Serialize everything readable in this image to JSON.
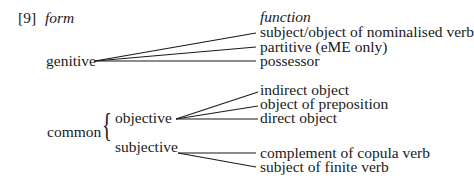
{
  "example_number": "[9]",
  "headers": {
    "form": "form",
    "function": "function"
  },
  "forms": {
    "genitive": "genitive",
    "common": "common",
    "objective": "objective",
    "subjective": "subjective"
  },
  "functions": {
    "genitive": [
      "subject/object of nominalised verb",
      "partitive (eME only)",
      "possessor"
    ],
    "objective": [
      "indirect object",
      "object of preposition",
      "direct object"
    ],
    "subjective": [
      "complement of copula verb",
      "subject of finite verb"
    ]
  }
}
